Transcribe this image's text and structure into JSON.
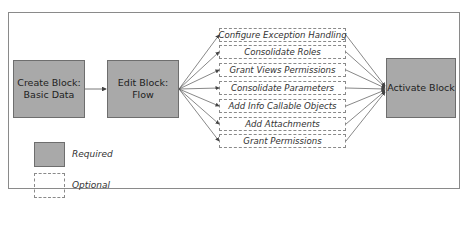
{
  "diagram": {
    "nodes": {
      "create": {
        "label_line1": "Create Block:",
        "label_line2": "Basic Data",
        "type": "required"
      },
      "edit": {
        "label_line1": "Edit Block:",
        "label_line2": "Flow",
        "type": "required"
      },
      "activate": {
        "label": "Activate Block",
        "type": "required"
      }
    },
    "optional_steps": [
      {
        "label": "Configure Exception Handling"
      },
      {
        "label": "Consolidate Roles"
      },
      {
        "label": "Grant Views Permissions"
      },
      {
        "label": "Consolidate Parameters"
      },
      {
        "label": "Add Info Callable Objects"
      },
      {
        "label": "Add Attachments"
      },
      {
        "label": "Grant Permissions"
      }
    ],
    "legend": {
      "required": "Required",
      "optional": "Optional"
    },
    "colors": {
      "required_fill": "#a9a9a9",
      "border": "#6e6e6e",
      "dashed": "#8a8a8a"
    }
  }
}
